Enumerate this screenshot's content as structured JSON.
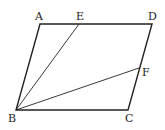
{
  "diagram": {
    "type": "parallelogram",
    "points": {
      "A": {
        "label": "A",
        "x": 40,
        "y": 24
      },
      "E": {
        "label": "E",
        "x": 79,
        "y": 24
      },
      "D": {
        "label": "D",
        "x": 152,
        "y": 24
      },
      "F": {
        "label": "F",
        "x": 139,
        "y": 68
      },
      "B": {
        "label": "B",
        "x": 16,
        "y": 110
      },
      "C": {
        "label": "C",
        "x": 128,
        "y": 110
      }
    },
    "edges": [
      "AD",
      "DC",
      "CB",
      "BA",
      "BE",
      "BF"
    ],
    "stroke_color": "#222222"
  }
}
